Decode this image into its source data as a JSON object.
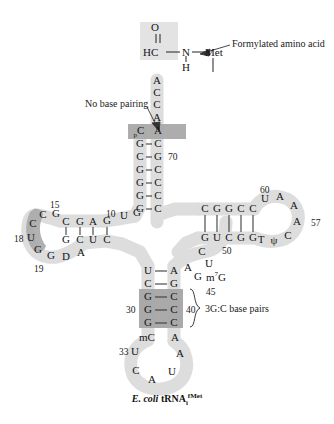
{
  "figure": {
    "caption_italic": "E. coli",
    "caption_roman": "tRNA",
    "caption_sub": "i",
    "caption_sup": "fMet"
  },
  "annotations": {
    "formylated": "Formylated amino acid",
    "no_base_pairing": "No base pairing",
    "gc_base_pairs": "3G:C base pairs"
  },
  "amino_acid": {
    "oxygen": "O",
    "hc": "HC",
    "n": "N",
    "h": "H",
    "met": "Met"
  },
  "acceptor_end": {
    "bases": [
      "A",
      "C",
      "C",
      "A",
      "A"
    ]
  },
  "acceptor_stem": {
    "left": [
      "pC",
      "G",
      "C",
      "G",
      "G",
      "G",
      "G"
    ],
    "right": [
      "A",
      "C",
      "G",
      "C",
      "C",
      "C",
      "C"
    ],
    "label_70": "70"
  },
  "d_arm": {
    "stem_top": [
      "C",
      "G",
      "A",
      "G"
    ],
    "stem_bottom": [
      "G",
      "C",
      "U",
      "C"
    ],
    "loop": [
      "G",
      "C",
      "C",
      "U",
      "G",
      "G",
      "D",
      "A"
    ],
    "label_10": "10",
    "label_15": "15",
    "label_18": "18",
    "label_19": "19"
  },
  "junction_left": {
    "bases": [
      "U",
      "G"
    ]
  },
  "t_arm": {
    "stem_top": [
      "C",
      "G",
      "G",
      "C",
      "C"
    ],
    "stem_bottom": [
      "G",
      "U",
      "C",
      "G",
      "G"
    ],
    "loop": [
      "U",
      "A",
      "A",
      "A",
      "C",
      "ψ",
      "T"
    ],
    "label_50": "50",
    "label_57": "57",
    "label_60": "60"
  },
  "variable_loop": {
    "bases": [
      "C",
      "U",
      "A",
      "G"
    ],
    "modified": "m7G",
    "label_45": "45"
  },
  "anticodon_stem": {
    "left": [
      "U",
      "C",
      "G",
      "G",
      "G",
      "mC"
    ],
    "right": [
      "A",
      "G",
      "C",
      "C",
      "C",
      "A"
    ],
    "label_30": "30",
    "label_40": "40"
  },
  "anticodon_loop": {
    "bases": [
      "U",
      "C",
      "A",
      "U",
      "A"
    ],
    "label_33": "33"
  },
  "colors": {
    "backbone_light": "#d9d9d9",
    "shade_dark": "#a8a8a8",
    "shade_mid": "#bcbcbc",
    "bond": "#3a3a3a",
    "text": "#141414"
  }
}
